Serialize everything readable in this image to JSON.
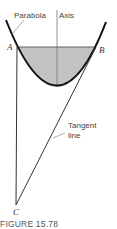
{
  "labels": {
    "parabola": "Parabola",
    "axis": "Axis",
    "point_a": "A",
    "point_b": "B",
    "point_c": "C",
    "tangent_line_1": "Tangent",
    "tangent_line_2": "line"
  },
  "caption": "FIGURE 15.78",
  "colors": {
    "region_fill": "#c2c2c2",
    "curve": "#111111",
    "lines": "#333333",
    "leader": "#888888"
  }
}
